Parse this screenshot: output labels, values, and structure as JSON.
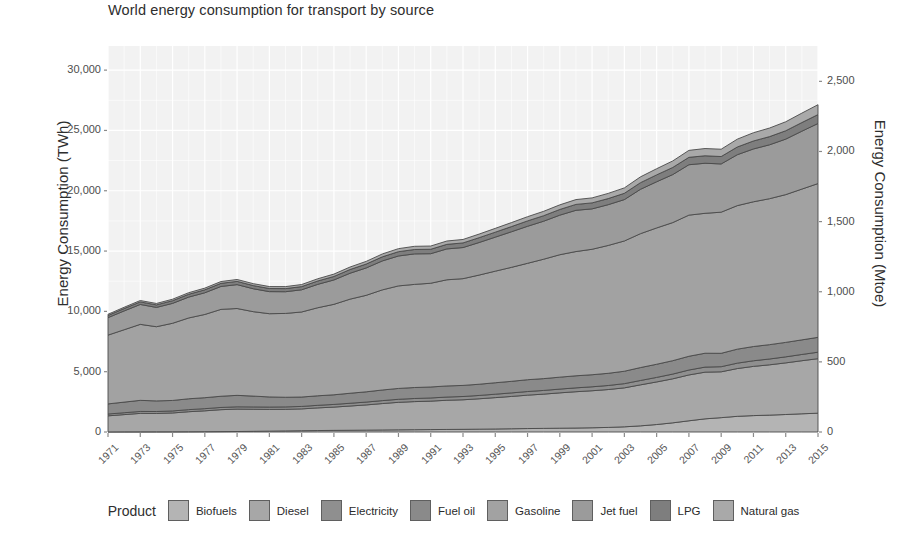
{
  "chart_data": {
    "type": "area",
    "stacked": true,
    "title": "World energy consumption for transport by source",
    "xlabel": "",
    "ylabel": "Energy Consumption (TWh)",
    "y2label": "Energy Consumption (Mtoe)",
    "legend_title": "Product",
    "legend_position": "bottom",
    "grid": true,
    "panel_background": "#f2f2f2",
    "xlim": [
      1971,
      2015
    ],
    "ylim": [
      0,
      32000
    ],
    "y2lim": [
      0,
      2752
    ],
    "y_ticks": [
      0,
      5000,
      10000,
      15000,
      20000,
      25000,
      30000
    ],
    "y_tick_labels": [
      "0",
      "5,000",
      "10,000",
      "15,000",
      "20,000",
      "25,000",
      "30,000"
    ],
    "y2_ticks": [
      0,
      500,
      1000,
      1500,
      2000,
      2500
    ],
    "y2_tick_labels": [
      "0",
      "500",
      "1,000",
      "1,500",
      "2,000",
      "2,500"
    ],
    "x": [
      1971,
      1972,
      1973,
      1974,
      1975,
      1976,
      1977,
      1978,
      1979,
      1980,
      1981,
      1982,
      1983,
      1984,
      1985,
      1986,
      1987,
      1988,
      1989,
      1990,
      1991,
      1992,
      1993,
      1994,
      1995,
      1996,
      1997,
      1998,
      1999,
      2000,
      2001,
      2002,
      2003,
      2004,
      2005,
      2006,
      2007,
      2008,
      2009,
      2010,
      2011,
      2012,
      2013,
      2014,
      2015
    ],
    "x_tick_labels": [
      "1971",
      "1973",
      "1975",
      "1977",
      "1979",
      "1981",
      "1983",
      "1985",
      "1987",
      "1989",
      "1991",
      "1993",
      "1995",
      "1997",
      "1999",
      "2001",
      "2003",
      "2005",
      "2007",
      "2009",
      "2011",
      "2013",
      "2015"
    ],
    "series": [
      {
        "name": "Biofuels",
        "color": "#b4b4b4",
        "values": [
          10,
          12,
          14,
          16,
          18,
          22,
          26,
          32,
          40,
          55,
          72,
          90,
          105,
          120,
          135,
          145,
          155,
          168,
          180,
          190,
          200,
          212,
          222,
          235,
          250,
          268,
          285,
          300,
          315,
          330,
          350,
          380,
          430,
          510,
          620,
          760,
          930,
          1090,
          1190,
          1300,
          1360,
          1400,
          1450,
          1510,
          1560
        ]
      },
      {
        "name": "Diesel",
        "color": "#a7a7a7",
        "values": [
          1330,
          1430,
          1530,
          1520,
          1560,
          1660,
          1730,
          1820,
          1860,
          1830,
          1800,
          1790,
          1810,
          1880,
          1930,
          2010,
          2090,
          2190,
          2280,
          2330,
          2360,
          2420,
          2450,
          2520,
          2600,
          2680,
          2770,
          2840,
          2930,
          3010,
          3070,
          3140,
          3230,
          3400,
          3530,
          3650,
          3800,
          3870,
          3800,
          3960,
          4080,
          4170,
          4280,
          4400,
          4520
        ]
      },
      {
        "name": "Electricity",
        "color": "#8f8f8f",
        "values": [
          150,
          155,
          160,
          162,
          166,
          172,
          178,
          183,
          188,
          192,
          196,
          200,
          205,
          212,
          220,
          228,
          236,
          244,
          252,
          258,
          262,
          266,
          270,
          276,
          284,
          292,
          300,
          306,
          312,
          320,
          328,
          336,
          348,
          362,
          376,
          392,
          408,
          420,
          424,
          448,
          466,
          482,
          500,
          518,
          536
        ]
      },
      {
        "name": "Fuel oil",
        "color": "#8a8a8a",
        "values": [
          840,
          880,
          920,
          880,
          870,
          900,
          910,
          930,
          950,
          900,
          840,
          800,
          780,
          790,
          800,
          830,
          850,
          880,
          900,
          910,
          910,
          920,
          920,
          930,
          950,
          960,
          980,
          980,
          990,
          1000,
          1000,
          1010,
          1030,
          1070,
          1090,
          1110,
          1140,
          1150,
          1110,
          1160,
          1180,
          1190,
          1200,
          1210,
          1230
        ]
      },
      {
        "name": "Gasoline",
        "color": "#a2a2a2",
        "values": [
          5700,
          6000,
          6300,
          6150,
          6400,
          6700,
          6900,
          7200,
          7200,
          7000,
          6900,
          6950,
          7050,
          7300,
          7500,
          7800,
          8000,
          8300,
          8500,
          8550,
          8600,
          8800,
          8850,
          9050,
          9250,
          9450,
          9650,
          9900,
          10150,
          10300,
          10400,
          10600,
          10800,
          11100,
          11300,
          11450,
          11700,
          11600,
          11700,
          11900,
          12000,
          12100,
          12250,
          12500,
          12750
        ]
      },
      {
        "name": "Jet fuel",
        "color": "#9b9b9b",
        "values": [
          1450,
          1560,
          1650,
          1600,
          1650,
          1730,
          1800,
          1900,
          1980,
          1900,
          1830,
          1800,
          1840,
          1940,
          2020,
          2150,
          2270,
          2400,
          2480,
          2530,
          2450,
          2560,
          2580,
          2700,
          2820,
          2950,
          3070,
          3150,
          3280,
          3420,
          3350,
          3380,
          3430,
          3680,
          3830,
          3980,
          4180,
          4150,
          4000,
          4220,
          4380,
          4470,
          4600,
          4800,
          4980
        ]
      },
      {
        "name": "LPG",
        "color": "#7e7e7e",
        "values": [
          180,
          195,
          210,
          210,
          220,
          232,
          244,
          258,
          268,
          262,
          258,
          258,
          264,
          278,
          290,
          306,
          322,
          340,
          356,
          364,
          368,
          378,
          384,
          398,
          412,
          428,
          444,
          456,
          472,
          488,
          496,
          506,
          520,
          548,
          570,
          590,
          614,
          620,
          612,
          640,
          660,
          676,
          694,
          716,
          738
        ]
      },
      {
        "name": "Natural gas",
        "color": "#a9a9a9",
        "values": [
          100,
          108,
          116,
          118,
          124,
          132,
          140,
          150,
          158,
          160,
          162,
          166,
          172,
          184,
          196,
          208,
          222,
          238,
          252,
          262,
          268,
          278,
          286,
          300,
          316,
          332,
          350,
          364,
          382,
          400,
          414,
          430,
          450,
          482,
          510,
          540,
          576,
          600,
          608,
          650,
          684,
          712,
          744,
          782,
          820
        ]
      }
    ],
    "stack_totals_note": "Areas are stacked in legend order: Biofuels bottom through Natural gas top."
  },
  "title": {
    "text": "World energy consumption for transport by source"
  },
  "axes": {
    "left_title": "Energy Consumption (TWh)",
    "right_title": "Energy Consumption (Mtoe)"
  },
  "legend": {
    "title": "Product",
    "items": [
      {
        "label": "Biofuels",
        "color": "#b4b4b4"
      },
      {
        "label": "Diesel",
        "color": "#a7a7a7"
      },
      {
        "label": "Electricity",
        "color": "#8f8f8f"
      },
      {
        "label": "Fuel oil",
        "color": "#8a8a8a"
      },
      {
        "label": "Gasoline",
        "color": "#a2a2a2"
      },
      {
        "label": "Jet fuel",
        "color": "#9b9b9b"
      },
      {
        "label": "LPG",
        "color": "#7e7e7e"
      },
      {
        "label": "Natural gas",
        "color": "#a9a9a9"
      }
    ]
  }
}
